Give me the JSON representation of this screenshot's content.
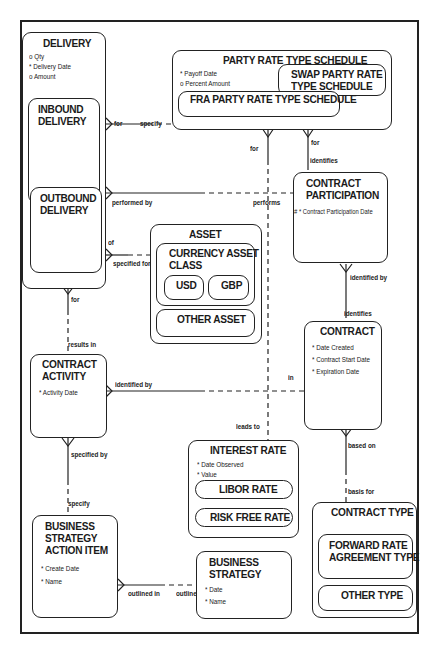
{
  "diagram": {
    "type": "entity-relationship",
    "entities": {
      "delivery": {
        "title": "DELIVERY",
        "attributes": [
          "o Qty",
          "* Delivery Date",
          "o Amount"
        ],
        "subtypes": {
          "inbound": {
            "title1": "INBOUND",
            "title2": "DELIVERY"
          },
          "outbound": {
            "title1": "OUTBOUND",
            "title2": "DELIVERY"
          }
        }
      },
      "party_rate_type_schedule": {
        "title": "PARTY RATE TYPE SCHEDULE",
        "attributes": [
          "* Payoff Date",
          "o Percent Amount"
        ],
        "subtypes": {
          "swap": {
            "title1": "SWAP PARTY RATE",
            "title2": "TYPE SCHEDULE"
          },
          "fra": {
            "title": "FRA PARTY RATE TYPE SCHEDULE"
          }
        }
      },
      "contract_participation": {
        "title1": "CONTRACT",
        "title2": "PARTICIPATION",
        "attributes": [
          "# * Contract Participation Date"
        ]
      },
      "asset": {
        "title": "ASSET",
        "subtypes": {
          "currency_asset_class": {
            "title1": "CURRENCY ASSET",
            "title2": "CLASS",
            "subtypes": {
              "usd": "USD",
              "gbp": "GBP"
            }
          },
          "other_asset": {
            "title": "OTHER ASSET"
          }
        }
      },
      "contract": {
        "title": "CONTRACT",
        "attributes": [
          "* Date Created",
          "* Contract Start Date",
          "* Expiration Date"
        ]
      },
      "contract_activity": {
        "title1": "CONTRACT",
        "title2": "ACTIVITY",
        "attributes": [
          "* Activity Date"
        ]
      },
      "interest_rate": {
        "title": "INTEREST RATE",
        "attributes": [
          "* Date Observed",
          "* Value"
        ],
        "subtypes": {
          "libor": "LIBOR RATE",
          "risk_free": "RISK FREE RATE"
        }
      },
      "contract_type": {
        "title": "CONTRACT TYPE",
        "subtypes": {
          "fra_type": {
            "title1": "FORWARD RATE",
            "title2": "AGREEMENT TYPE"
          },
          "other_type": {
            "title": "OTHER TYPE"
          }
        }
      },
      "business_strategy_action_item": {
        "title1": "BUSINESS",
        "title2": "STRATEGY",
        "title3": "ACTION ITEM",
        "attributes": [
          "* Create Date",
          "* Name"
        ]
      },
      "business_strategy": {
        "title1": "BUSINESS",
        "title2": "STRATEGY",
        "attributes": [
          "* Date",
          "* Name"
        ]
      }
    },
    "relationship_labels": {
      "delivery_for": "for",
      "schedule_specify": "specify",
      "delivery_performed_by": "performed by",
      "participation_performs": "performs",
      "delivery_of": "of",
      "asset_specified_for": "specified for",
      "schedule_for_left": "for",
      "schedule_for_right": "for",
      "participation_identifies": "identifies",
      "participation_identified_by": "identified by",
      "contract_identifies": "identifies",
      "delivery_for_bottom": "for",
      "activity_results_in": "results in",
      "activity_identified_by": "identified by",
      "contract_in": "in",
      "interest_leads_to": "leads to",
      "contract_based_on": "based on",
      "type_basis_for": "basis for",
      "activity_specified_by": "specified by",
      "action_specify": "specify",
      "action_outlined_in": "outlined in",
      "strategy_outline": "outline"
    }
  }
}
